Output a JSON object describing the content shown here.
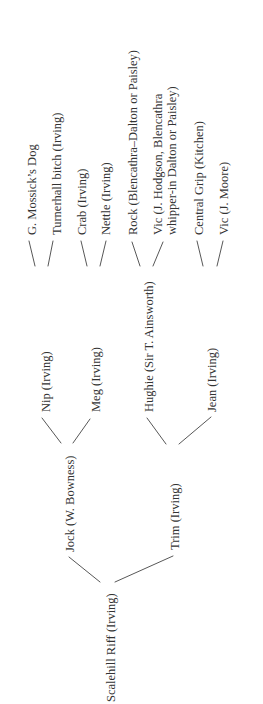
{
  "diagram": {
    "type": "pedigree-tree",
    "orientation": "rotated -90deg, root at bottom, branches upward",
    "line_color": "#444444",
    "text_color": "#333333"
  },
  "pedigree": {
    "label": "Scalehill Riff (Irving)",
    "branches": [
      {
        "label": "Jock (W. Bowness)",
        "branches": [
          {
            "label": "Nip (Irving)",
            "branches": [
              {
                "label": "G. Mossick’s Dog"
              },
              {
                "label": "Turnerhall bitch (Irving)"
              }
            ]
          },
          {
            "label": "Meg (Irving)",
            "branches": [
              {
                "label": "Crab (Irving)"
              },
              {
                "label": "Nettle (Irving)"
              }
            ]
          }
        ]
      },
      {
        "label": "Trim (Irving)",
        "branches": [
          {
            "label": "Hughie (Sir T. Ainsworth)",
            "branches": [
              {
                "label": "Rock (Blencathra–Dalton or Paisley)"
              },
              {
                "label": "Vic (J. Hodgson, Blencathra whipper-in Dalton or Paisley)",
                "label_lines": [
                  "Vic (J. Hodgson, Blencathra",
                  "whipper-in Dalton or Paisley)"
                ]
              }
            ]
          },
          {
            "label": "Jean (Irving)",
            "branches": [
              {
                "label": "Central Grip (Kitchen)"
              },
              {
                "label": "Vic (J. Moore)"
              }
            ]
          }
        ]
      }
    ]
  }
}
